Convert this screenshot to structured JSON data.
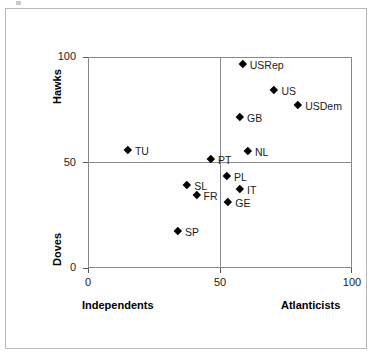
{
  "chart_data": {
    "type": "scatter",
    "title": "",
    "xlabel_left": "Independents",
    "xlabel_right": "Atlanticists",
    "ylabel_top": "Hawks",
    "ylabel_bottom": "Doves",
    "xlim": [
      0,
      100
    ],
    "ylim": [
      0,
      100
    ],
    "xticks": [
      0,
      50,
      100
    ],
    "yticks": [
      0,
      50,
      100
    ],
    "xtick_labels": [
      "0",
      "50",
      "100"
    ],
    "ytick_labels": [
      "0",
      "50",
      "100"
    ],
    "grid": true,
    "gridlines": {
      "x": [
        50
      ],
      "y": [
        50
      ]
    },
    "legend": "none",
    "marker": "diamond",
    "marker_color": "#000000",
    "points": [
      {
        "label": "USRep",
        "x": 59.0,
        "y": 96.0,
        "label_side": "right"
      },
      {
        "label": "US",
        "x": 71.0,
        "y": 84.0,
        "label_side": "right"
      },
      {
        "label": "USDem",
        "x": 80.0,
        "y": 77.0,
        "label_side": "right"
      },
      {
        "label": "GB",
        "x": 58.0,
        "y": 71.0,
        "label_side": "right"
      },
      {
        "label": "TU",
        "x": 15.5,
        "y": 55.5,
        "label_side": "right"
      },
      {
        "label": "NL",
        "x": 61.0,
        "y": 55.0,
        "label_side": "right"
      },
      {
        "label": "PT",
        "x": 47.0,
        "y": 51.0,
        "label_side": "right"
      },
      {
        "label": "PL",
        "x": 53.0,
        "y": 43.0,
        "label_side": "right"
      },
      {
        "label": "SL",
        "x": 38.0,
        "y": 39.0,
        "label_side": "right"
      },
      {
        "label": "IT",
        "x": 58.0,
        "y": 37.0,
        "label_side": "right"
      },
      {
        "label": "FR",
        "x": 41.5,
        "y": 34.0,
        "label_side": "right"
      },
      {
        "label": "GE",
        "x": 53.5,
        "y": 31.0,
        "label_side": "right"
      },
      {
        "label": "SP",
        "x": 34.5,
        "y": 17.0,
        "label_side": "right"
      }
    ]
  },
  "axes": {
    "y_title_top": "Hawks",
    "y_title_bottom": "Doves",
    "x_title_left": "Independents",
    "x_title_right": "Atlanticists"
  },
  "ticks": {
    "y": [
      {
        "value": 100,
        "label": "100"
      },
      {
        "value": 50,
        "label": "50"
      },
      {
        "value": 0,
        "label": "0"
      }
    ],
    "x": [
      {
        "value": 0,
        "label": "0"
      },
      {
        "value": 50,
        "label": "50"
      },
      {
        "value": 100,
        "label": "100"
      }
    ]
  }
}
